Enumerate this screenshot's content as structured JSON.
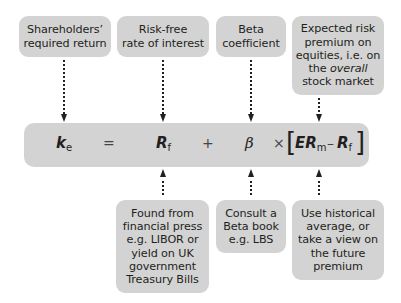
{
  "top_boxes": [
    {
      "label": "Shareholders’\nrequired return"
    },
    {
      "label": "Risk-free\nrate of interest"
    },
    {
      "label": "Beta\ncoefficient"
    },
    {
      "label_line1": "Expected risk\npremium on\nequities, i.e. on\nthe ",
      "label_italic": "overall",
      "label_line2": "stock market"
    }
  ],
  "formula": {
    "ke": "k",
    "ke_sub": "e",
    "equals": "=",
    "rf": "R",
    "rf_sub": "f",
    "plus": "+",
    "beta": "β",
    "times": "×",
    "bracket_open": "[",
    "erm": "ER",
    "erm_sub": "m",
    "minus": "–",
    "rf2": "R",
    "rf2_sub": "f",
    "bracket_close": "]"
  },
  "bottom_boxes": [
    {
      "label": "Found from\nfinancial press\ne.g. LIBOR or\nyield on UK\ngovernment\nTreasury Bills"
    },
    {
      "label": "Consult a\nBeta book\ne.g. LBS"
    },
    {
      "label": "Use historical\naverage, or\ntake a view on\nthe future\npremium"
    }
  ],
  "colors": {
    "box_fill": "#d3d3d3",
    "text": "#231f20"
  }
}
